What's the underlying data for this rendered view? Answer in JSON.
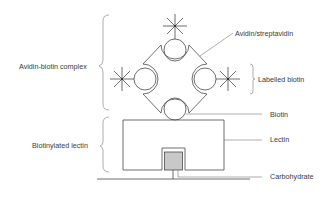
{
  "diagram": {
    "colors": {
      "line": "#4a4a4a",
      "carbohydrate_fill": "#c8c8c8",
      "text": "#3a3a3a",
      "background": "#ffffff"
    },
    "labels": {
      "avidin_streptavidin": "Avidin/streptavidin",
      "labelled_biotin": "Labelled biotin",
      "biotin": "Biotin",
      "lectin": "Lectin",
      "carbohydrate": "Carbohydrate",
      "avidin_biotin_complex": "Avidin-biotin complex",
      "biotinylated_lectin": "Biotinylated lectin"
    },
    "components": {
      "biotin_circles": 4,
      "labelled_stars": 3
    }
  }
}
